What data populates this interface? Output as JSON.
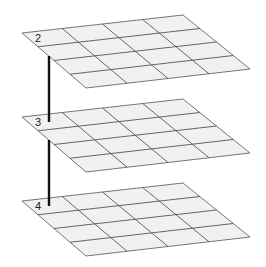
{
  "diagram": {
    "type": "stacked-layer-grids",
    "grid": {
      "rows": 4,
      "cols": 4
    },
    "colors": {
      "plane_fill": "#f1f1f1",
      "grid_line": "#555555",
      "connector": "#111111",
      "label": "#222222"
    },
    "layers": [
      {
        "label": "2",
        "corners": {
          "left": [
            22,
            33
          ],
          "back": [
            183,
            15
          ],
          "right": [
            250,
            69
          ],
          "front": [
            86,
            88
          ]
        }
      },
      {
        "label": "3",
        "corners": {
          "left": [
            22,
            117
          ],
          "back": [
            183,
            99
          ],
          "right": [
            250,
            153
          ],
          "front": [
            86,
            172
          ]
        }
      },
      {
        "label": "4",
        "corners": {
          "left": [
            22,
            201
          ],
          "back": [
            183,
            183
          ],
          "right": [
            250,
            237
          ],
          "front": [
            86,
            256
          ]
        }
      }
    ],
    "connectors": [
      {
        "from_layer": "2",
        "to_layer": "3",
        "x": 49,
        "y1": 56,
        "y2": 122
      },
      {
        "from_layer": "3",
        "to_layer": "4",
        "x": 49,
        "y1": 140,
        "y2": 206
      }
    ]
  }
}
